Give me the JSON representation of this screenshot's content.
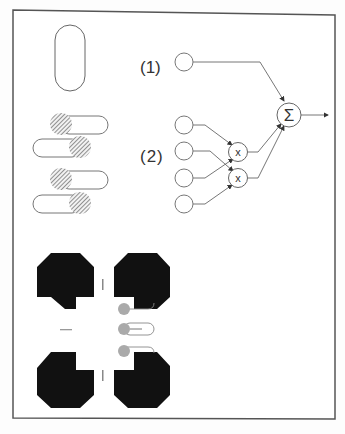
{
  "figure": {
    "frame": {
      "stroke": "#555555"
    },
    "colors": {
      "line": "#666666",
      "fill_black": "#111111",
      "hatch": "#777777",
      "grey_dot": "#aaaaaa"
    },
    "left_column": {
      "vertical_capsule": {
        "shape": "capsule-outline"
      },
      "hatched_capsules": [
        {
          "hatch_side": "left"
        },
        {
          "hatch_side": "right"
        },
        {
          "hatch_side": "left"
        },
        {
          "hatch_side": "right"
        }
      ]
    },
    "network": {
      "label_1": "(1)",
      "label_2": "(2)",
      "input_nodes_group1": 1,
      "input_nodes_group2": 4,
      "multiply_nodes": [
        {
          "label": "x"
        },
        {
          "label": "x"
        }
      ],
      "sum_node": {
        "label": "Σ"
      },
      "output": "arrow"
    },
    "bottom_pattern": {
      "octagons": 4,
      "shape": "notched-octagon",
      "grey_dot_capsules": 3
    },
    "caption": ""
  }
}
